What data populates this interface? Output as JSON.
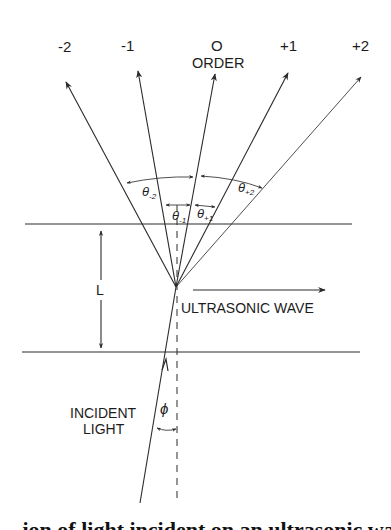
{
  "diagram": {
    "order_labels": [
      "-2",
      "-1",
      "O",
      "+1",
      "+2"
    ],
    "order_caption": "ORDER",
    "angle_labels": {
      "theta_m2": {
        "base": "θ",
        "sub": "-2"
      },
      "theta_m1": {
        "base": "θ",
        "sub": "-1"
      },
      "theta_p1": {
        "base": "θ",
        "sub": "+1"
      },
      "theta_p2": {
        "base": "θ",
        "sub": "+2"
      }
    },
    "thickness_label": "L",
    "wave_label": "ULTRASONIC WAVE",
    "incident_label_line1": "INCIDENT",
    "incident_label_line2": "LIGHT",
    "incidence_angle_label": "ϕ",
    "caption_partial": "...ion of light incident on an ultrasonic wave ..."
  }
}
